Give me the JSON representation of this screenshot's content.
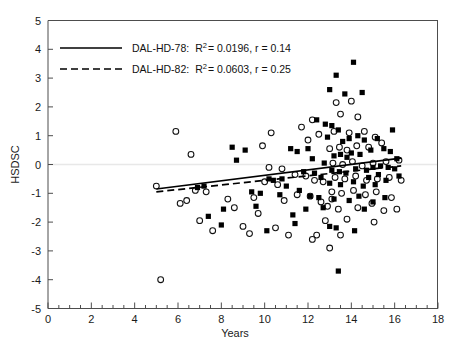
{
  "chart_data": {
    "type": "scatter",
    "title": "",
    "xlabel": "Years",
    "ylabel": "HSDSC",
    "xlim": [
      0,
      18
    ],
    "ylim": [
      -5,
      5
    ],
    "xticks": [
      0,
      2,
      4,
      6,
      8,
      10,
      12,
      14,
      16,
      18
    ],
    "yticks": [
      -5,
      -4,
      -3,
      -2,
      -1,
      0,
      1,
      2,
      3,
      4,
      5
    ],
    "xtick_labels": [
      "0",
      "2",
      "4",
      "6",
      "8",
      "10",
      "12",
      "14",
      "16",
      "18"
    ],
    "ytick_labels": [
      "-5",
      "-4",
      "-3",
      "-2",
      "-1",
      "0",
      "1",
      "2",
      "3",
      "4",
      "5"
    ],
    "xtick_minor_step": 0.5,
    "ytick_minor": false,
    "grid": false,
    "zero_reference_line": true,
    "legend_position": "top-left",
    "legend": [
      {
        "label": "DAL-HD-78:",
        "marker": "filled-square",
        "line_style": "solid",
        "r_squared": "0.0196",
        "r": "0.14",
        "stat_text": "R2 = 0.0196, r = 0.14"
      },
      {
        "label": "DAL-HD-82:",
        "marker": "open-circle",
        "line_style": "dashed",
        "r_squared": "0.0603",
        "r": "0.25",
        "stat_text": "R2 = 0.0603, r = 0.25"
      }
    ],
    "fit_lines": [
      {
        "name": "DAL-HD-78",
        "style": "solid",
        "x_start": 5.0,
        "y_start": -0.85,
        "x_end": 16.3,
        "y_end": 0.22
      },
      {
        "name": "DAL-HD-82",
        "style": "dashed",
        "x_start": 5.0,
        "y_start": -0.95,
        "x_end": 16.3,
        "y_end": -0.05
      }
    ],
    "series": [
      {
        "name": "DAL-HD-78",
        "marker": "filled-square",
        "points": [
          [
            8.5,
            0.6
          ],
          [
            9.1,
            0.5
          ],
          [
            8.7,
            0.15
          ],
          [
            10.2,
            -0.5
          ],
          [
            10.4,
            -0.55
          ],
          [
            10.8,
            -0.5
          ],
          [
            9.4,
            -0.95
          ],
          [
            9.8,
            -1.0
          ],
          [
            10.7,
            -1.05
          ],
          [
            8.1,
            -1.55
          ],
          [
            9.6,
            -1.45
          ],
          [
            11.2,
            0.55
          ],
          [
            11.5,
            0.45
          ],
          [
            12.0,
            0.55
          ],
          [
            11.8,
            -0.25
          ],
          [
            12.3,
            -0.3
          ],
          [
            12.6,
            -0.45
          ],
          [
            11.0,
            -0.75
          ],
          [
            11.6,
            -0.9
          ],
          [
            12.1,
            -1.1
          ],
          [
            12.8,
            1.4
          ],
          [
            13.1,
            1.35
          ],
          [
            13.4,
            1.2
          ],
          [
            13.0,
            2.6
          ],
          [
            13.7,
            2.45
          ],
          [
            14.5,
            2.5
          ],
          [
            13.3,
            3.1
          ],
          [
            14.1,
            3.55
          ],
          [
            12.4,
            1.55
          ],
          [
            12.9,
            0.95
          ],
          [
            13.6,
            0.8
          ],
          [
            13.9,
            0.9
          ],
          [
            14.3,
            1.0
          ],
          [
            14.6,
            0.85
          ],
          [
            13.2,
            0.3
          ],
          [
            13.5,
            0.35
          ],
          [
            13.8,
            0.25
          ],
          [
            14.0,
            0.4
          ],
          [
            14.4,
            0.35
          ],
          [
            14.9,
            0.5
          ],
          [
            15.2,
            0.9
          ],
          [
            15.5,
            0.55
          ],
          [
            15.8,
            0.45
          ],
          [
            13.1,
            -0.2
          ],
          [
            13.45,
            -0.25
          ],
          [
            13.75,
            -0.3
          ],
          [
            14.2,
            -0.15
          ],
          [
            14.7,
            -0.2
          ],
          [
            15.0,
            -0.1
          ],
          [
            15.35,
            -0.05
          ],
          [
            15.7,
            -0.1
          ],
          [
            16.0,
            -0.15
          ],
          [
            13.0,
            -0.65
          ],
          [
            13.5,
            -0.7
          ],
          [
            14.1,
            -0.6
          ],
          [
            14.55,
            -0.75
          ],
          [
            15.1,
            -0.7
          ],
          [
            15.6,
            -0.55
          ],
          [
            12.5,
            -1.15
          ],
          [
            13.2,
            -1.2
          ],
          [
            13.9,
            -1.25
          ],
          [
            14.35,
            -1.1
          ],
          [
            15.0,
            -1.3
          ],
          [
            15.55,
            -1.15
          ],
          [
            11.9,
            -1.55
          ],
          [
            12.7,
            -1.5
          ],
          [
            14.6,
            -1.55
          ],
          [
            13.0,
            -2.15
          ],
          [
            13.3,
            -2.2
          ],
          [
            13.4,
            -3.7
          ],
          [
            7.4,
            -1.8
          ],
          [
            8.0,
            -2.1
          ],
          [
            6.9,
            -0.8
          ],
          [
            7.2,
            -0.75
          ],
          [
            10.1,
            -2.3
          ],
          [
            11.4,
            -2.05
          ],
          [
            15.9,
            1.2
          ],
          [
            16.1,
            0.2
          ],
          [
            16.2,
            -0.4
          ],
          [
            12.2,
            0.2
          ],
          [
            12.75,
            0.05
          ],
          [
            11.3,
            -1.75
          ],
          [
            14.8,
            -0.45
          ],
          [
            15.25,
            -0.35
          ],
          [
            14.15,
            -2.3
          ]
        ]
      },
      {
        "name": "DAL-HD-82",
        "marker": "open-circle",
        "points": [
          [
            5.9,
            1.15
          ],
          [
            6.6,
            0.35
          ],
          [
            5.0,
            -0.75
          ],
          [
            5.2,
            -4.0
          ],
          [
            6.1,
            -1.35
          ],
          [
            6.4,
            -1.25
          ],
          [
            7.0,
            -1.95
          ],
          [
            7.6,
            -2.3
          ],
          [
            8.3,
            -1.2
          ],
          [
            8.6,
            -1.5
          ],
          [
            9.0,
            -2.15
          ],
          [
            9.3,
            -2.4
          ],
          [
            6.8,
            -0.9
          ],
          [
            7.3,
            -0.95
          ],
          [
            9.9,
            0.65
          ],
          [
            10.3,
            1.1
          ],
          [
            10.0,
            -0.6
          ],
          [
            10.6,
            -0.7
          ],
          [
            9.5,
            -1.15
          ],
          [
            10.9,
            -1.25
          ],
          [
            10.5,
            -2.2
          ],
          [
            11.1,
            -2.45
          ],
          [
            11.7,
            1.3
          ],
          [
            12.2,
            1.55
          ],
          [
            12.0,
            0.85
          ],
          [
            12.5,
            1.05
          ],
          [
            11.4,
            -0.35
          ],
          [
            11.9,
            -0.4
          ],
          [
            12.3,
            -0.55
          ],
          [
            12.7,
            -0.6
          ],
          [
            11.5,
            -1.05
          ],
          [
            12.1,
            -1.1
          ],
          [
            12.6,
            -1.3
          ],
          [
            13.1,
            -1.2
          ],
          [
            12.4,
            -2.45
          ],
          [
            13.0,
            -2.9
          ],
          [
            13.3,
            2.15
          ],
          [
            14.0,
            2.2
          ],
          [
            13.5,
            1.75
          ],
          [
            14.3,
            1.65
          ],
          [
            13.2,
            1.15
          ],
          [
            13.9,
            1.1
          ],
          [
            14.6,
            1.15
          ],
          [
            15.1,
            0.95
          ],
          [
            13.0,
            0.55
          ],
          [
            13.45,
            0.6
          ],
          [
            13.8,
            0.5
          ],
          [
            14.25,
            0.65
          ],
          [
            14.8,
            0.6
          ],
          [
            15.4,
            0.75
          ],
          [
            13.15,
            0.05
          ],
          [
            13.6,
            0.0
          ],
          [
            14.05,
            0.1
          ],
          [
            14.5,
            -0.05
          ],
          [
            15.0,
            0.05
          ],
          [
            15.6,
            0.1
          ],
          [
            16.2,
            0.15
          ],
          [
            13.25,
            -0.45
          ],
          [
            13.7,
            -0.5
          ],
          [
            14.2,
            -0.4
          ],
          [
            14.7,
            -0.55
          ],
          [
            15.2,
            -0.5
          ],
          [
            15.75,
            -0.45
          ],
          [
            13.1,
            -0.95
          ],
          [
            13.55,
            -1.0
          ],
          [
            14.1,
            -0.9
          ],
          [
            14.65,
            -1.05
          ],
          [
            15.15,
            -0.95
          ],
          [
            12.9,
            -1.45
          ],
          [
            13.4,
            -1.55
          ],
          [
            14.3,
            -1.5
          ],
          [
            15.5,
            -1.6
          ],
          [
            16.1,
            -1.55
          ],
          [
            12.8,
            -1.95
          ],
          [
            13.8,
            -1.9
          ],
          [
            15.05,
            -2.0
          ],
          [
            12.2,
            -2.6
          ],
          [
            13.5,
            -2.45
          ],
          [
            10.2,
            -0.1
          ],
          [
            10.8,
            -0.15
          ],
          [
            9.7,
            -1.7
          ],
          [
            16.3,
            -0.55
          ],
          [
            15.85,
            -1.15
          ],
          [
            14.95,
            -1.35
          ]
        ]
      }
    ]
  }
}
